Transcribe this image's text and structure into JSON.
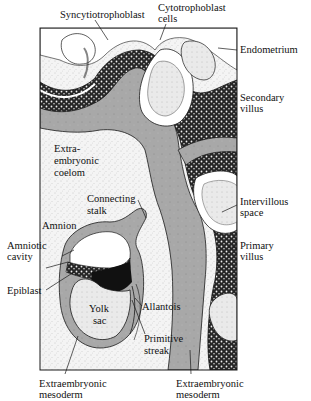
{
  "figure": {
    "type": "anatomical-diagram",
    "colors": {
      "background": "#ffffff",
      "stipple_cavity": "#f1f1f1",
      "mesoderm_gray": "#a9a9a9",
      "trophoblast_dark": "#2a2a2a",
      "lacuna_light": "#e4e4e4",
      "outline": "#1a1a1a"
    }
  },
  "labels": {
    "syncytiotrophoblast": "Syncytiotrophoblast",
    "cytotrophoblast_1": "Cytotrophoblast",
    "cytotrophoblast_2": "cells",
    "endometrium": "Endometrium",
    "secondary_villus_1": "Secondary",
    "secondary_villus_2": "villus",
    "extraembryonic_coelom_1": "Extra-",
    "extraembryonic_coelom_2": "embryonic",
    "extraembryonic_coelom_3": "coelom",
    "connecting_stalk_1": "Connecting",
    "connecting_stalk_2": "stalk",
    "intervillous_space_1": "Intervillous",
    "intervillous_space_2": "space",
    "amnion": "Amnion",
    "amniotic_cavity_1": "Amniotic",
    "amniotic_cavity_2": "cavity",
    "primary_villus_1": "Primary",
    "primary_villus_2": "villus",
    "epiblast": "Epiblast",
    "yolk_sac_1": "Yolk",
    "yolk_sac_2": "sac",
    "allantois": "Allantois",
    "primitive_streak_1": "Primitive",
    "primitive_streak_2": "streak",
    "extraembryonic_mesoderm_left_1": "Extraembryonic",
    "extraembryonic_mesoderm_left_2": "mesoderm",
    "extraembryonic_mesoderm_right_1": "Extraembryonic",
    "extraembryonic_mesoderm_right_2": "mesoderm"
  }
}
